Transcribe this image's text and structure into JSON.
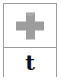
{
  "card": {
    "icon_cell": {
      "icon_name": "plus-cross-icon",
      "icon_color": "#9d9d9d",
      "icon_label": "+"
    },
    "char_cell": {
      "character": "t"
    },
    "border_color": "#9b9b9b",
    "background_color": "#ffffff"
  }
}
